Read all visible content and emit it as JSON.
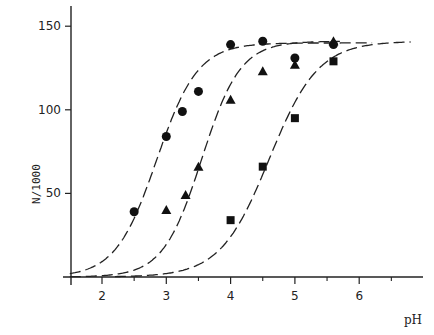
{
  "chart_data": {
    "type": "scatter",
    "title": "",
    "xlabel": "pH",
    "ylabel": "N/1000",
    "xlim": [
      1.5,
      7.0
    ],
    "ylim": [
      0,
      160
    ],
    "x_ticks": [
      2,
      3,
      4,
      5,
      6
    ],
    "x_minor_ticks": [
      2.5,
      3.5,
      4.5,
      5.5,
      6.5
    ],
    "y_ticks": [
      50,
      100,
      150
    ],
    "grid": false,
    "legend": null,
    "series": [
      {
        "name": "circles",
        "marker": "circle",
        "x": [
          2.5,
          3.0,
          3.25,
          3.5,
          4.0,
          4.5,
          5.0,
          5.6
        ],
        "y": [
          39,
          84,
          99,
          111,
          139,
          141,
          131,
          139
        ],
        "fit": {
          "type": "sigmoid",
          "plateau": 140,
          "midpoint": 2.85,
          "slope": 0.32,
          "x_range": [
            1.5,
            6.2
          ],
          "style": "long-dash"
        }
      },
      {
        "name": "triangles",
        "marker": "triangle",
        "x": [
          3.0,
          3.3,
          3.5,
          4.0,
          4.5,
          5.0,
          5.6
        ],
        "y": [
          40,
          49,
          66,
          106,
          123,
          127,
          141
        ],
        "fit": {
          "type": "sigmoid",
          "plateau": 141,
          "midpoint": 3.55,
          "slope": 0.3,
          "x_range": [
            1.5,
            5.7
          ],
          "style": "long-dash"
        }
      },
      {
        "name": "squares",
        "marker": "square",
        "x": [
          4.0,
          4.5,
          5.0,
          5.6
        ],
        "y": [
          34,
          66,
          95,
          129
        ],
        "fit": {
          "type": "sigmoid",
          "plateau": 141,
          "midpoint": 4.6,
          "slope": 0.38,
          "x_range": [
            2.2,
            6.8
          ],
          "style": "long-dash"
        }
      }
    ]
  },
  "labels": {
    "ylabel": "N/1000",
    "xlabel": "pH"
  }
}
